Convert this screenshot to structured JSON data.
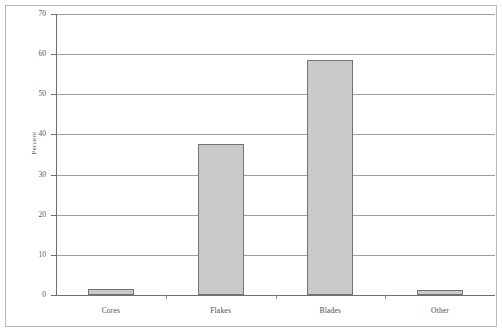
{
  "chart_data": {
    "type": "bar",
    "title": "",
    "xlabel": "",
    "ylabel": "Percent",
    "categories": [
      "Cores",
      "Flakes",
      "Blades",
      "Other"
    ],
    "values": [
      1.4,
      37.6,
      58.6,
      1.3
    ],
    "ylim": [
      0,
      70
    ],
    "ytick_labels": [
      "0",
      "10",
      "20",
      "30",
      "40",
      "50",
      "60",
      "70"
    ],
    "ytick_values": [
      0,
      10,
      20,
      30,
      40,
      50,
      60,
      70
    ],
    "grid": "horizontal",
    "legend": "none",
    "bar_fill_color": "#c9c9c9",
    "bar_border_color": "#737373",
    "gridline_color": "#9d9d9d",
    "axis_color": "#6f6f6f",
    "frame_color": "#b9b9b9",
    "background_color": "#ffffff"
  }
}
